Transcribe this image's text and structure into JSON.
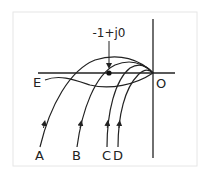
{
  "diagram": {
    "type": "nyquist-style loci diagram",
    "frame_color": "#e6e6e6",
    "line_color": "#222222",
    "critical_point": {
      "label": "-1+j0",
      "x": 109,
      "y": 73
    },
    "origin": {
      "label": "O",
      "x": 153,
      "y": 73
    },
    "curves": [
      {
        "id": "A",
        "label": "A"
      },
      {
        "id": "B",
        "label": "B"
      },
      {
        "id": "C",
        "label": "C"
      },
      {
        "id": "D",
        "label": "D"
      },
      {
        "id": "E",
        "label": "E"
      }
    ]
  }
}
